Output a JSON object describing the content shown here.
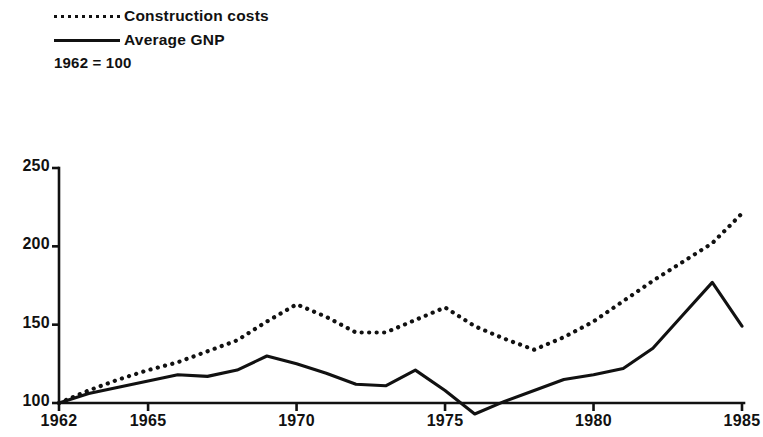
{
  "legend": {
    "items": [
      {
        "label": "Construction costs",
        "style": "dotted"
      },
      {
        "label": "Average GNP",
        "style": "solid"
      }
    ],
    "note": "1962 = 100"
  },
  "axes": {
    "y_ticks": [
      "100",
      "150",
      "200",
      "250"
    ],
    "x_ticks": [
      "1962",
      "1965",
      "1970",
      "1975",
      "1980",
      "1985"
    ]
  },
  "chart_data": {
    "type": "line",
    "title": "",
    "subtitle": "1962 = 100",
    "xlabel": "",
    "ylabel": "",
    "xlim": [
      1962,
      1985
    ],
    "ylim": [
      90,
      260
    ],
    "grid": false,
    "legend_position": "top-left",
    "x": [
      1962,
      1963,
      1964,
      1965,
      1966,
      1967,
      1968,
      1969,
      1970,
      1971,
      1972,
      1973,
      1974,
      1975,
      1976,
      1977,
      1978,
      1979,
      1980,
      1981,
      1982,
      1983,
      1984,
      1985
    ],
    "xtick_values": [
      1962,
      1965,
      1970,
      1975,
      1980,
      1985
    ],
    "xtick_labels": [
      "1962",
      "1965",
      "1970",
      "1975",
      "1980",
      "1985"
    ],
    "ytick_values": [
      100,
      150,
      200,
      250
    ],
    "ytick_labels": [
      "100",
      "150",
      "200",
      "250"
    ],
    "series": [
      {
        "name": "Construction costs",
        "style": "dotted",
        "color": "#111111",
        "values": [
          100,
          108,
          115,
          121,
          126,
          133,
          140,
          152,
          163,
          155,
          145,
          145,
          153,
          161,
          149,
          141,
          134,
          142,
          152,
          165,
          178,
          190,
          202,
          221
        ]
      },
      {
        "name": "Average GNP",
        "style": "solid",
        "color": "#111111",
        "values": [
          100,
          106,
          110,
          114,
          118,
          117,
          121,
          130,
          125,
          119,
          112,
          111,
          121,
          108,
          93,
          101,
          108,
          115,
          118,
          122,
          135,
          156,
          177,
          149
        ]
      }
    ]
  }
}
